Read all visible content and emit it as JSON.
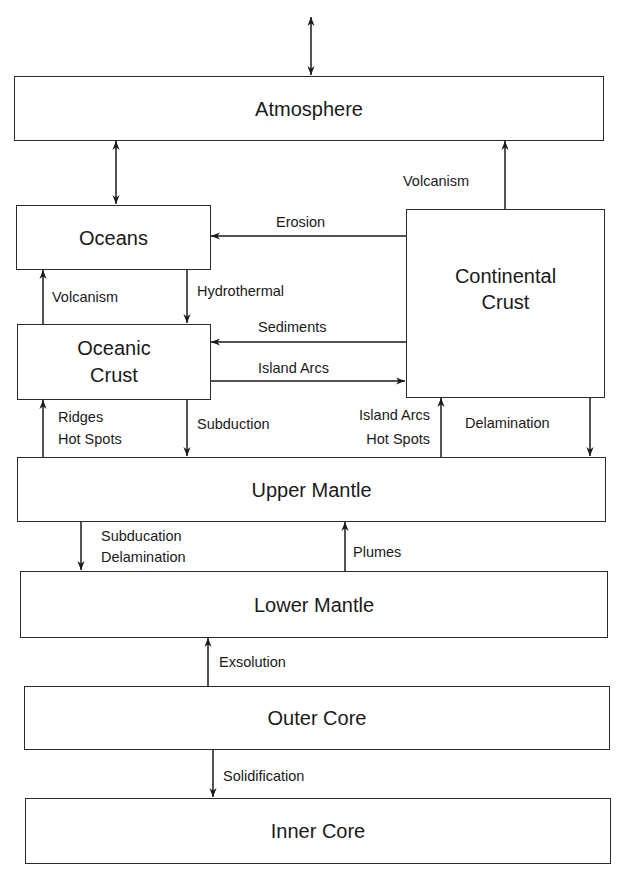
{
  "diagram": {
    "boxes": {
      "atmosphere": "Atmosphere",
      "oceans": "Oceans",
      "continental_crust": "Continental Crust",
      "oceanic_crust": "Oceanic Crust",
      "upper_mantle": "Upper Mantle",
      "lower_mantle": "Lower Mantle",
      "outer_core": "Outer Core",
      "inner_core": "Inner Core"
    },
    "flows": {
      "volcanism_continental": "Volcanism",
      "erosion": "Erosion",
      "volcanism_oceanic": "Volcanism",
      "hydrothermal": "Hydrothermal",
      "sediments": "Sediments",
      "island_arcs_to_continent": "Island Arcs",
      "ridges": "Ridges",
      "hot_spots_oceanic": "Hot Spots",
      "subduction": "Subduction",
      "island_arcs_mantle": "Island Arcs",
      "hot_spots_continental": "Hot Spots",
      "delamination": "Delamination",
      "subducation": "Subducation",
      "delamination_lower": "Delamination",
      "plumes": "Plumes",
      "exsolution": "Exsolution",
      "solidification": "Solidification"
    }
  }
}
